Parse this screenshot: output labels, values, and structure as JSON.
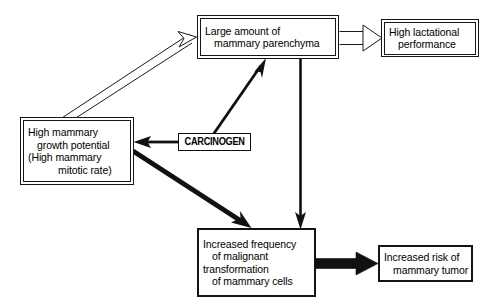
{
  "diagram": {
    "background_color": "#ffffff",
    "ink_color": "#111111",
    "nodes": [
      {
        "id": "mammary_growth_potential",
        "lines": [
          "High mammary",
          "growth potential",
          "(High mammary",
          "mitotic rate)"
        ],
        "border_style": "double"
      },
      {
        "id": "mammary_parenchyma",
        "lines": [
          "Large amount of",
          "mammary parenchyma"
        ],
        "border_style": "double"
      },
      {
        "id": "lactational_performance",
        "lines": [
          "High lactational",
          "performance"
        ],
        "border_style": "double"
      },
      {
        "id": "carcinogen",
        "lines": [
          "CARCINOGEN"
        ],
        "border_style": "single"
      },
      {
        "id": "malignant_transformation",
        "lines": [
          "Increased frequency",
          "of malignant",
          "transformation",
          "of mammary cells"
        ],
        "border_style": "single"
      },
      {
        "id": "mammary_tumor_risk",
        "lines": [
          "Increased risk of",
          "mammary tumor"
        ],
        "border_style": "single"
      }
    ],
    "edges": [
      {
        "id": "growth-to-parenchyma",
        "from": "mammary_growth_potential",
        "to": "mammary_parenchyma",
        "style": "hollow-double-line"
      },
      {
        "id": "parenchyma-to-lactation",
        "from": "mammary_parenchyma",
        "to": "lactational_performance",
        "style": "hollow-double-line"
      },
      {
        "id": "parenchyma-to-malignant",
        "from": "mammary_parenchyma",
        "to": "malignant_transformation",
        "style": "solid-thin"
      },
      {
        "id": "carcinogen-to-parenchyma",
        "from": "carcinogen",
        "to": "mammary_parenchyma",
        "style": "solid-thin"
      },
      {
        "id": "carcinogen-to-growth",
        "from": "carcinogen",
        "to": "mammary_growth_potential",
        "style": "solid-thin"
      },
      {
        "id": "growth-to-malignant",
        "from": "mammary_growth_potential",
        "to": "malignant_transformation",
        "style": "solid-thick"
      },
      {
        "id": "malignant-to-tumor",
        "from": "malignant_transformation",
        "to": "mammary_tumor_risk",
        "style": "solid-block"
      }
    ]
  }
}
